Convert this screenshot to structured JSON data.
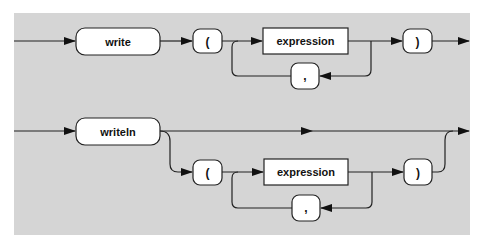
{
  "diagram": {
    "type": "syntax-diagram",
    "background_color": "#d5d5d5",
    "box_fill": "#ffffff",
    "line_color": "#222222",
    "rows": [
      {
        "name": "write-statement",
        "keyword": "write",
        "open_paren": "(",
        "expression": "expression",
        "separator": ",",
        "close_paren": ")"
      },
      {
        "name": "writeln-statement",
        "keyword": "writeln",
        "open_paren": "(",
        "expression": "expression",
        "separator": ",",
        "close_paren": ")",
        "optional_arguments": true
      }
    ]
  }
}
